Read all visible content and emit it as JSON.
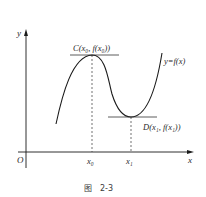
{
  "figure": {
    "caption_prefix": "图",
    "caption_number": "2-3",
    "axes": {
      "x_label": "x",
      "y_label": "y",
      "origin_label": "O"
    },
    "curve_label": "y=f(x)",
    "points": {
      "max": {
        "name": "C",
        "label": "C(x₀, f(x₀))",
        "x_tick": "x₀"
      },
      "min": {
        "name": "D",
        "label": "D(x₁, f(x₁))",
        "x_tick": "x₁"
      }
    },
    "colors": {
      "line": "#1a1a1a",
      "text": "#2a2a2a",
      "background": "#ffffff"
    }
  }
}
